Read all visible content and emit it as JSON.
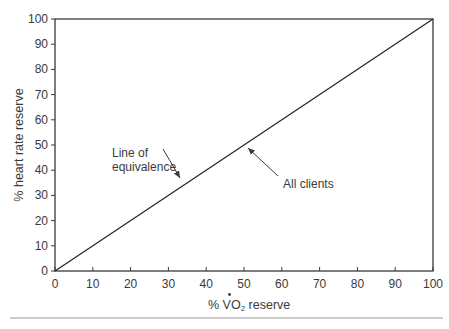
{
  "chart_data": {
    "type": "line",
    "title": "",
    "xlabel": "% VO2 reserve",
    "xlabel_parts": {
      "prefix": "% ",
      "v": "V",
      "o": "O",
      "sub": "2",
      "suffix": " reserve"
    },
    "ylabel": "% heart rate reserve",
    "xlim": [
      0,
      100
    ],
    "ylim": [
      0,
      100
    ],
    "xticks": [
      0,
      10,
      20,
      30,
      40,
      50,
      60,
      70,
      80,
      90,
      100
    ],
    "yticks": [
      0,
      10,
      20,
      30,
      40,
      50,
      60,
      70,
      80,
      90,
      100
    ],
    "grid": false,
    "legend": null,
    "series": [
      {
        "name": "Line of equivalence / All clients",
        "x": [
          0,
          100
        ],
        "y": [
          0,
          100
        ]
      }
    ],
    "annotations": [
      {
        "text_lines": [
          "Line of",
          "equivalence"
        ],
        "arrow_to": [
          33,
          37
        ]
      },
      {
        "text_lines": [
          "All clients"
        ],
        "arrow_to": [
          51,
          48
        ]
      }
    ]
  }
}
